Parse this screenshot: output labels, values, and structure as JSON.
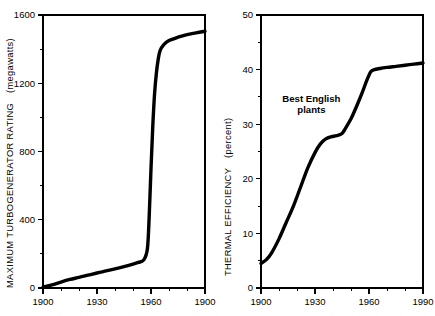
{
  "figure": {
    "background_color": "#ffffff",
    "ink_color": "#000000"
  },
  "chart_data": [
    {
      "id": "turbogenerator-rating",
      "type": "line",
      "title": "",
      "xlabel": "",
      "ylabel": "MAXIMUM TURBOGENERATOR RATING  (megawatts)",
      "ylabel_main": "MAXIMUM  TURBOGENERATOR  RATING",
      "ylabel_units": "(megawatts)",
      "xlim": [
        1900,
        1990
      ],
      "ylim": [
        0,
        1600
      ],
      "grid": false,
      "legend": "none",
      "x_ticks_major": [
        1900,
        1930,
        1960,
        1990
      ],
      "x_tick_labels": [
        "1900",
        "1930",
        "1960",
        "1900"
      ],
      "x_ticks_minor": [
        1910,
        1920,
        1940,
        1950,
        1970,
        1980
      ],
      "y_ticks_major": [
        0,
        400,
        800,
        1200,
        1600
      ],
      "y_tick_labels": [
        "0",
        "400",
        "800",
        "1200",
        "1600"
      ],
      "y_ticks_minor": [
        200,
        600,
        1000,
        1400
      ],
      "series": [
        {
          "name": "Maximum turbogenerator rating",
          "x": [
            1900,
            1905,
            1910,
            1915,
            1920,
            1925,
            1930,
            1935,
            1940,
            1945,
            1950,
            1953,
            1956,
            1958,
            1959,
            1960,
            1961,
            1962,
            1963,
            1964,
            1965,
            1967,
            1970,
            1975,
            1980,
            1985,
            1990
          ],
          "values": [
            5,
            18,
            35,
            50,
            62,
            75,
            88,
            100,
            112,
            125,
            140,
            150,
            165,
            230,
            420,
            700,
            950,
            1140,
            1260,
            1340,
            1390,
            1425,
            1450,
            1470,
            1485,
            1495,
            1505
          ]
        }
      ]
    },
    {
      "id": "thermal-efficiency",
      "type": "line",
      "title": "",
      "xlabel": "",
      "ylabel": "THERMAL EFFICIENCY  (percent)",
      "ylabel_main": "THERMAL  EFFICIENCY",
      "ylabel_units": "(percent)",
      "xlim": [
        1900,
        1990
      ],
      "ylim": [
        0,
        50
      ],
      "grid": false,
      "legend": "none",
      "x_ticks_major": [
        1900,
        1930,
        1960,
        1990
      ],
      "x_tick_labels": [
        "1900",
        "1930",
        "1960",
        "1990"
      ],
      "x_ticks_minor": [
        1910,
        1920,
        1940,
        1950,
        1970,
        1980
      ],
      "y_ticks_major": [
        0,
        10,
        20,
        30,
        40,
        50
      ],
      "y_tick_labels": [
        "0",
        "10",
        "20",
        "30",
        "40",
        "50"
      ],
      "y_ticks_minor": [
        5,
        15,
        25,
        35,
        45
      ],
      "annotations": [
        {
          "name": "best-english-plants",
          "text_line1": "Best English",
          "text_line2": "plants",
          "x": 1928,
          "y": 34
        }
      ],
      "series": [
        {
          "name": "Best English plants thermal efficiency",
          "x": [
            1900,
            1903,
            1906,
            1910,
            1914,
            1918,
            1922,
            1926,
            1930,
            1933,
            1936,
            1939,
            1942,
            1945,
            1947,
            1950,
            1953,
            1956,
            1959,
            1961,
            1963,
            1966,
            1970,
            1975,
            1980,
            1985,
            1990
          ],
          "values": [
            4.5,
            5.2,
            6.5,
            9.0,
            12.0,
            15.0,
            18.5,
            22.0,
            24.8,
            26.4,
            27.3,
            27.7,
            27.9,
            28.3,
            29.3,
            31.0,
            33.2,
            35.6,
            38.2,
            39.6,
            40.0,
            40.2,
            40.4,
            40.6,
            40.8,
            41.0,
            41.2
          ]
        }
      ]
    }
  ]
}
